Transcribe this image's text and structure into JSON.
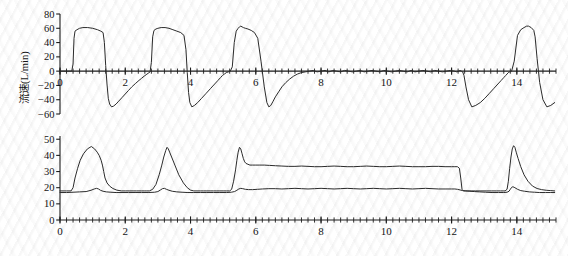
{
  "figure": {
    "title": "",
    "background_color": "#ffffff",
    "trace_color": "#2b2b2b"
  },
  "chart_data": [
    {
      "type": "line",
      "id": "flow-waveform",
      "title": "",
      "xlabel": "",
      "ylabel": "流速(L/min)",
      "ylabel_plain": "Flow (L/min)",
      "xlim": [
        0,
        15.2
      ],
      "ylim": [
        -60,
        80
      ],
      "yticks": [
        -60,
        -40,
        -20,
        0,
        20,
        40,
        60,
        80
      ],
      "ytick_labels": [
        "−60",
        "−40",
        "−20",
        "0",
        "20",
        "40",
        "60",
        "80"
      ],
      "xticks": [
        0,
        2,
        4,
        6,
        8,
        10,
        12,
        14
      ],
      "xtick_labels": [
        "0",
        "2",
        "4",
        "6",
        "8",
        "10",
        "12",
        "14"
      ],
      "xtick_minor_step": 0.2,
      "grid": false,
      "legend": "none",
      "annotations": [
        "Square-wave inspiratory flow bursts peaking near 60 L/min",
        "Passive exponential expiratory flow troughs near −50 L/min",
        "Zero-flow plateau (inspiratory hold) from about 6.0 s to 12.3 s",
        "Large expiratory release spike near 12.3 s reaching about −50 L/min"
      ],
      "series": [
        {
          "name": "流速",
          "name_plain": "Flow",
          "color": "#2b2b2b",
          "units": "L/min",
          "x": [
            0.0,
            0.2,
            0.36,
            0.4,
            0.43,
            0.46,
            0.52,
            0.6,
            0.7,
            0.85,
            1.0,
            1.15,
            1.25,
            1.32,
            1.36,
            1.4,
            1.44,
            1.48,
            1.52,
            1.58,
            1.64,
            1.72,
            1.8,
            1.9,
            2.0,
            2.1,
            2.2,
            2.32,
            2.42,
            2.5,
            2.58,
            2.64,
            2.7,
            2.76,
            2.8,
            2.84,
            2.88,
            2.94,
            3.0,
            3.1,
            3.22,
            3.34,
            3.46,
            3.58,
            3.7,
            3.8,
            3.86,
            3.9,
            3.94,
            3.98,
            4.04,
            4.12,
            4.22,
            4.34,
            4.48,
            4.62,
            4.74,
            4.84,
            4.92,
            4.98,
            5.04,
            5.1,
            5.16,
            5.22,
            5.28,
            5.34,
            5.4,
            5.46,
            5.5,
            5.54,
            5.58,
            5.62,
            5.68,
            5.76,
            5.86,
            5.96,
            6.06,
            6.16,
            6.26,
            6.34,
            6.4,
            6.46,
            6.52,
            6.6,
            6.7,
            6.8,
            6.92,
            7.04,
            7.16,
            7.28,
            7.4,
            7.52,
            7.64,
            7.76,
            7.88,
            8.0,
            8.12,
            8.24,
            8.36,
            8.48,
            8.6,
            8.72,
            8.84,
            8.96,
            9.08,
            9.2,
            9.32,
            9.44,
            9.56,
            9.68,
            9.8,
            9.92,
            10.04,
            10.16,
            10.28,
            10.4,
            10.52,
            10.64,
            10.76,
            10.88,
            11.0,
            11.12,
            11.24,
            11.36,
            11.48,
            11.6,
            11.72,
            11.84,
            11.96,
            12.08,
            12.16,
            12.22,
            12.26,
            12.3,
            12.34,
            12.38,
            12.44,
            12.52,
            12.62,
            12.74,
            12.88,
            13.02,
            13.16,
            13.3,
            13.42,
            13.52,
            13.6,
            13.66,
            13.7,
            13.74,
            13.78,
            13.84,
            13.92,
            14.02,
            14.12,
            14.22,
            14.3,
            14.36,
            14.4,
            14.44,
            14.48,
            14.52,
            14.56,
            14.62,
            14.7,
            14.8,
            14.92,
            15.04,
            15.16
          ],
          "y": [
            0,
            0,
            0,
            10,
            46,
            56,
            58,
            60,
            61,
            61,
            60,
            58,
            56,
            54,
            40,
            8,
            -18,
            -38,
            -46,
            -50,
            -49,
            -46,
            -42,
            -37,
            -32,
            -27,
            -22,
            -17,
            -13,
            -10,
            -7,
            -5,
            -3,
            -1,
            12,
            48,
            57,
            59,
            60,
            61,
            61,
            60,
            58,
            56,
            54,
            50,
            30,
            -2,
            -30,
            -44,
            -50,
            -48,
            -44,
            -38,
            -31,
            -24,
            -18,
            -13,
            -9,
            -6,
            -4,
            -2,
            -1,
            0,
            6,
            40,
            56,
            60,
            62,
            63,
            62,
            61,
            60,
            59,
            57,
            54,
            46,
            14,
            -22,
            -44,
            -50,
            -48,
            -43,
            -36,
            -29,
            -22,
            -16,
            -11,
            -7,
            -4,
            -2,
            -1,
            0,
            1,
            -1,
            0,
            1,
            -1,
            1,
            0,
            -1,
            1,
            0,
            -1,
            0,
            1,
            -1,
            0,
            1,
            0,
            -1,
            1,
            0,
            -1,
            0,
            1,
            0,
            -1,
            1,
            -1,
            0,
            1,
            0,
            -1,
            1,
            0,
            -1,
            0,
            1,
            0,
            -1,
            0,
            1,
            0,
            -1,
            -6,
            -22,
            -40,
            -50,
            -48,
            -44,
            -38,
            -31,
            -24,
            -18,
            -13,
            -9,
            -6,
            -4,
            -2,
            -1,
            0,
            14,
            50,
            58,
            61,
            63,
            63,
            62,
            61,
            59,
            57,
            48,
            18,
            -16,
            -40,
            -50,
            -48,
            -44,
            -38,
            -31,
            -24,
            -18,
            -13,
            -9,
            -6,
            -4
          ]
        }
      ]
    },
    {
      "type": "line",
      "id": "pressure-waveform",
      "title": "",
      "xlabel": "",
      "ylabel_airway": "气道压(cmH2O)",
      "ylabel_esoph": "食管压(cmH2O)",
      "ylabel_airway_plain": "Airway pressure (cmH2O)",
      "ylabel_esoph_plain": "Esophageal pressure (cmH2O)",
      "xlim": [
        0,
        15.2
      ],
      "ylim": [
        0,
        52
      ],
      "yticks": [
        0,
        10,
        20,
        30,
        40,
        50
      ],
      "ytick_labels": [
        "0",
        "10",
        "20",
        "30",
        "40",
        "50"
      ],
      "xticks": [
        0,
        2,
        4,
        6,
        8,
        10,
        12,
        14
      ],
      "xtick_labels": [
        "0",
        "2",
        "4",
        "6",
        "8",
        "10",
        "12",
        "14"
      ],
      "xtick_minor_step": 0.2,
      "grid": false,
      "legend": "none",
      "annotations": [
        "Airway pressure peaks near 45 cmH2O on each tidal breath",
        "Inspiratory hold plateau about 33 cmH2O from 6.0 s to 12.3 s",
        "Esophageal pressure baseline about 17-18 cmH2O, rising to about 20 during hold",
        "Both pressures return to baseline after release at 12.3 s"
      ],
      "series": [
        {
          "name": "气道压",
          "name_plain": "Airway pressure",
          "color": "#2b2b2b",
          "units": "cmH2O",
          "x": [
            0.0,
            0.2,
            0.34,
            0.4,
            0.46,
            0.54,
            0.62,
            0.72,
            0.84,
            0.96,
            1.06,
            1.14,
            1.2,
            1.26,
            1.3,
            1.34,
            1.38,
            1.44,
            1.52,
            1.62,
            1.74,
            1.88,
            2.0,
            2.12,
            2.24,
            2.34,
            2.42,
            2.5,
            2.58,
            2.66,
            2.74,
            2.84,
            2.94,
            3.04,
            3.12,
            3.18,
            3.24,
            3.28,
            3.32,
            3.36,
            3.42,
            3.52,
            3.64,
            3.78,
            3.9,
            4.0,
            4.1,
            4.2,
            4.3,
            4.4,
            4.5,
            4.6,
            4.7,
            4.8,
            4.9,
            5.0,
            5.1,
            5.2,
            5.26,
            5.32,
            5.38,
            5.42,
            5.46,
            5.5,
            5.54,
            5.58,
            5.62,
            5.66,
            5.7,
            5.76,
            5.82,
            5.9,
            6.0,
            6.12,
            6.26,
            6.42,
            6.6,
            6.8,
            7.0,
            7.2,
            7.4,
            7.6,
            7.8,
            8.0,
            8.2,
            8.4,
            8.6,
            8.8,
            9.0,
            9.2,
            9.4,
            9.6,
            9.8,
            10.0,
            10.2,
            10.4,
            10.6,
            10.8,
            11.0,
            11.2,
            11.4,
            11.6,
            11.8,
            12.0,
            12.1,
            12.18,
            12.24,
            12.28,
            12.32,
            12.36,
            12.42,
            12.5,
            12.6,
            12.74,
            12.9,
            13.06,
            13.22,
            13.38,
            13.5,
            13.58,
            13.64,
            13.7,
            13.74,
            13.78,
            13.82,
            13.86,
            13.9,
            13.94,
            13.98,
            14.04,
            14.12,
            14.22,
            14.34,
            14.48,
            14.62,
            14.76,
            14.9,
            15.04,
            15.16
          ],
          "y": [
            18,
            18,
            18,
            20,
            26,
            32,
            37,
            41,
            44,
            45.5,
            44,
            42,
            40,
            37,
            34,
            30,
            26,
            23,
            21,
            19.5,
            18.5,
            18,
            18,
            18,
            18,
            18,
            18,
            18,
            18,
            18,
            18,
            19,
            22,
            28,
            34,
            39,
            43,
            45,
            44,
            42,
            39,
            34,
            28,
            23,
            20,
            18.5,
            18,
            18,
            18,
            18,
            18,
            18,
            18,
            18,
            18,
            18,
            18,
            18,
            19,
            24,
            31,
            37,
            42,
            45,
            44,
            41,
            38,
            36,
            35,
            34.5,
            34,
            34,
            34,
            34,
            34,
            33.8,
            33.6,
            33.4,
            33.2,
            33.2,
            33.4,
            33.2,
            33,
            33,
            33.2,
            33.4,
            33.2,
            33,
            33,
            33.2,
            33.4,
            33.2,
            33,
            33,
            33.2,
            33.4,
            33.2,
            33,
            33,
            33,
            33.2,
            33.2,
            33,
            33,
            33,
            33,
            32,
            26,
            19,
            18,
            18,
            18,
            18,
            18,
            18,
            18,
            18,
            18,
            18,
            18,
            18,
            19,
            24,
            32,
            39,
            44,
            46,
            45,
            42,
            38,
            33,
            28,
            24,
            21,
            19.5,
            18.8,
            18.4,
            18.2,
            18,
            18,
            18,
            18
          ]
        },
        {
          "name": "食管压",
          "name_plain": "Esophageal pressure",
          "color": "#2b2b2b",
          "units": "cmH2O",
          "x": [
            0.0,
            0.2,
            0.4,
            0.6,
            0.8,
            0.95,
            1.05,
            1.12,
            1.18,
            1.24,
            1.32,
            1.42,
            1.56,
            1.72,
            1.9,
            2.1,
            2.3,
            2.5,
            2.7,
            2.9,
            3.0,
            3.08,
            3.14,
            3.2,
            3.26,
            3.34,
            3.44,
            3.58,
            3.74,
            3.92,
            4.1,
            4.3,
            4.5,
            4.7,
            4.9,
            5.1,
            5.25,
            5.35,
            5.42,
            5.48,
            5.54,
            5.6,
            5.68,
            5.78,
            5.9,
            6.05,
            6.2,
            6.4,
            6.6,
            6.8,
            7.0,
            7.2,
            7.4,
            7.6,
            7.8,
            8.0,
            8.2,
            8.4,
            8.6,
            8.8,
            9.0,
            9.2,
            9.4,
            9.6,
            9.8,
            10.0,
            10.2,
            10.4,
            10.6,
            10.8,
            11.0,
            11.2,
            11.4,
            11.6,
            11.8,
            12.0,
            12.1,
            12.18,
            12.26,
            12.34,
            12.44,
            12.56,
            12.7,
            12.86,
            13.04,
            13.24,
            13.44,
            13.6,
            13.7,
            13.76,
            13.8,
            13.84,
            13.88,
            13.94,
            14.02,
            14.12,
            14.24,
            14.38,
            14.54,
            14.7,
            14.88,
            15.04,
            15.16
          ],
          "y": [
            17,
            17,
            17.2,
            17.4,
            17.6,
            18.4,
            19.2,
            19.6,
            19.2,
            18.4,
            17.8,
            17.4,
            17.2,
            17,
            17,
            17,
            17,
            17,
            17,
            17.2,
            17.6,
            18.6,
            19.4,
            19.6,
            19,
            18.4,
            17.8,
            17.4,
            17.2,
            17,
            17,
            17,
            17,
            17,
            17,
            17,
            17.2,
            17.6,
            18.4,
            19.2,
            19.6,
            19.4,
            19,
            18.8,
            18.8,
            19,
            19.2,
            19.4,
            19.4,
            19.2,
            19.4,
            19.6,
            19.4,
            19.2,
            19.4,
            19.6,
            19.4,
            19.2,
            19.4,
            19.6,
            19.4,
            19.2,
            19.4,
            19.6,
            19.4,
            19.2,
            19.4,
            19.6,
            19.4,
            19.2,
            19.4,
            19.6,
            19.4,
            19.2,
            19.2,
            19.2,
            19.2,
            19,
            18.6,
            18.2,
            18,
            17.8,
            17.6,
            17.4,
            17.2,
            17,
            17,
            17,
            17.2,
            17.8,
            19,
            20.2,
            20.6,
            20,
            19,
            18.2,
            17.8,
            17.4,
            17.2,
            17,
            17,
            17,
            17
          ]
        }
      ]
    }
  ]
}
